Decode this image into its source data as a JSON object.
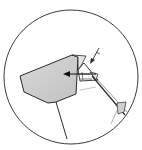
{
  "figure": {
    "type": "patent-style detail view",
    "background": "#ffffff",
    "stroke_color": "#2a2a2a",
    "fill_shade": "#cfcfcf",
    "detail_circle": {
      "cx": 71,
      "cy": 76,
      "r": 68
    },
    "elements": [
      {
        "name": "shaded-polygon",
        "description": "Grey shaded block/housing on left"
      },
      {
        "name": "triangular-bracket",
        "description": "Small triangular piece with hatching near center"
      },
      {
        "name": "pointer-arrow-left",
        "description": "Arrow pointing left into the shaded block"
      },
      {
        "name": "pointer-arrow-diagonal",
        "description": "Diagonal arrow pointing down-left at top right"
      },
      {
        "name": "diagonal-rod",
        "description": "Long diagonal line toward lower right"
      },
      {
        "name": "vertical-line",
        "description": "Line from block down to circle bottom"
      },
      {
        "name": "lower-right-fragment",
        "description": "Small triangular fragment at lower right edge"
      }
    ]
  }
}
